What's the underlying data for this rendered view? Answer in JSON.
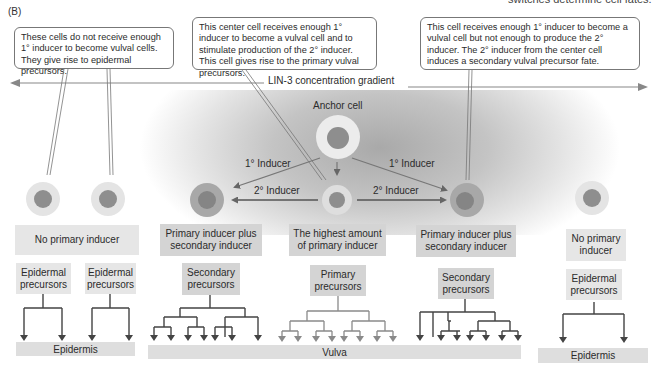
{
  "panel_label": "(B)",
  "cropped_header_text": "switches determine cell fates.",
  "callouts": {
    "left": "These cells do not receive enough 1° inducer to become vulval cells. They give rise to epidermal precursors.",
    "center": "This center cell receives enough 1° inducer to become a vulval cell and to stimulate production of the 2° inducer. This cell gives rise to the primary vulval precursors.",
    "right": "This cell receives enough 1° inducer to become a vulval cell but not enough to produce the 2° inducer. The 2° inducer from the center cell induces a secondary vulval precursor fate."
  },
  "gradient_label": "LIN-3 concentration gradient",
  "anchor_cell_label": "Anchor cell",
  "inducer_labels": {
    "primary_left": "1° Inducer",
    "primary_right": "1° Inducer",
    "secondary_left": "2° Inducer",
    "secondary_right": "2° Inducer"
  },
  "conditions": {
    "left": "No primary inducer",
    "left_secondary": "Primary inducer plus secondary inducer",
    "center": "The highest amount of primary inducer",
    "right_secondary": "Primary inducer plus secondary inducer",
    "right": "No primary inducer"
  },
  "precursors": {
    "epidermal_1": "Epidermal precursors",
    "epidermal_2": "Epidermal precursors",
    "secondary_left": "Secondary precursors",
    "primary": "Primary precursors",
    "secondary_right": "Secondary precursors",
    "epidermal_3": "Epidermal precursors"
  },
  "outcomes": {
    "epidermis_left": "Epidermis",
    "vulva": "Vulva",
    "epidermis_right": "Epidermis"
  },
  "colors": {
    "cell_nucleus": "#8e8e8e",
    "cell_cytoplasm_light": "#e4e4e4",
    "cell_cytoplasm_secondary": "#a8a8a8",
    "gradient_dark": "#a9a9a9",
    "line": "#555555",
    "primary_tree_line": "#8a8a8a"
  }
}
